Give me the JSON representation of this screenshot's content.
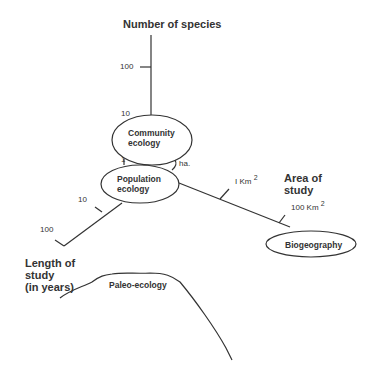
{
  "diagram": {
    "axes": {
      "species": {
        "title": "Number of species",
        "ticks": [
          "100",
          "10"
        ]
      },
      "area": {
        "title_line1": "Area of",
        "title_line2": "study",
        "ticks": [
          {
            "value": "I Km",
            "exp": "2"
          },
          {
            "value": "100 Km",
            "exp": "2"
          }
        ]
      },
      "length": {
        "title_line1": "Length of",
        "title_line2": "study",
        "title_line3": "(in years)",
        "ticks": [
          "10",
          "100"
        ]
      }
    },
    "nodes": {
      "community": {
        "line1": "Community",
        "line2": "ecology"
      },
      "population": {
        "line1": "Population",
        "line2": "ecology"
      },
      "biogeography": {
        "label": "Biogeography"
      },
      "paleo": {
        "label": "Paleo-ecology"
      }
    },
    "small_labels": {
      "one": "1",
      "ha": "ha."
    },
    "colors": {
      "line": "#333333",
      "text": "#2a2a2a",
      "background": "#ffffff"
    }
  }
}
